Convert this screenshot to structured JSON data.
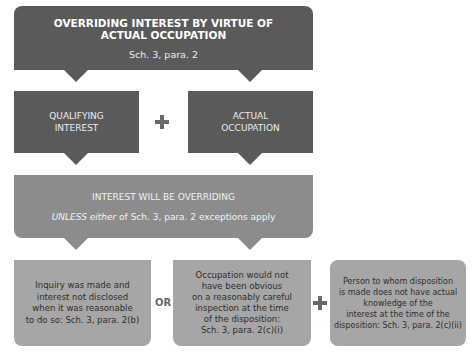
{
  "top": {
    "title_line1": "OVERRIDING INTEREST BY VIRTUE OF",
    "title_line2": "ACTUAL OCCUPATION",
    "subtitle": "Sch. 3, para. 2"
  },
  "requirements": [
    {
      "line1": "QUALIFYING",
      "line2": "INTEREST"
    },
    {
      "line1": "ACTUAL",
      "line2": "OCCUPATION"
    }
  ],
  "result": {
    "title": "INTEREST WILL BE OVERRIDING",
    "note_italic": "UNLESS either",
    "note_rest": " of Sch. 3, para. 2 exceptions apply"
  },
  "exceptions": [
    {
      "lines": [
        "Inquiry was made and",
        "interest not disclosed",
        "when it was reasonable",
        "to do so: Sch. 3, para. 2(b)"
      ]
    },
    {
      "lines": [
        "Occupation would not",
        "have been obvious",
        "on a reasonably careful",
        "inspection at the time",
        "of the disposition:",
        "Sch. 3, para. 2(c)(i)"
      ]
    },
    {
      "lines": [
        "Person to whom disposition",
        "is made does not have actual",
        "knowledge of the",
        "interest at the time of the",
        "disposition: Sch. 3, para. 2(c)(ii)"
      ]
    }
  ],
  "operators": {
    "or": "OR"
  }
}
